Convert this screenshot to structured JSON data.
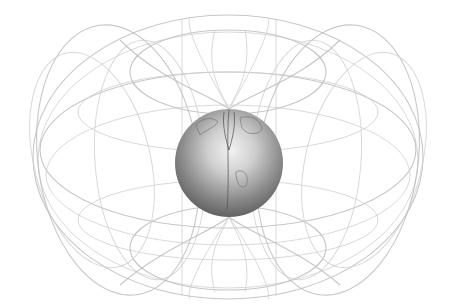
{
  "diagram": {
    "subject": "Earth's dipole magnetic field",
    "elements": {
      "globe": {
        "label": "Earth",
        "center": [
          229,
          163
        ],
        "radius": 54,
        "shade_light": "#e6e6e6",
        "shade_dark": "#6a6a6a"
      },
      "field_envelope": {
        "label": "Magnetic field lines",
        "center": [
          228,
          157
        ],
        "rx": 195,
        "ry": 142,
        "line_color": "#bdbdbd"
      }
    },
    "colors": {
      "background": "#ffffff",
      "field_lines": "#bdbdbd",
      "globe_dark": "#6a6a6a",
      "globe_light": "#e6e6e6"
    }
  }
}
